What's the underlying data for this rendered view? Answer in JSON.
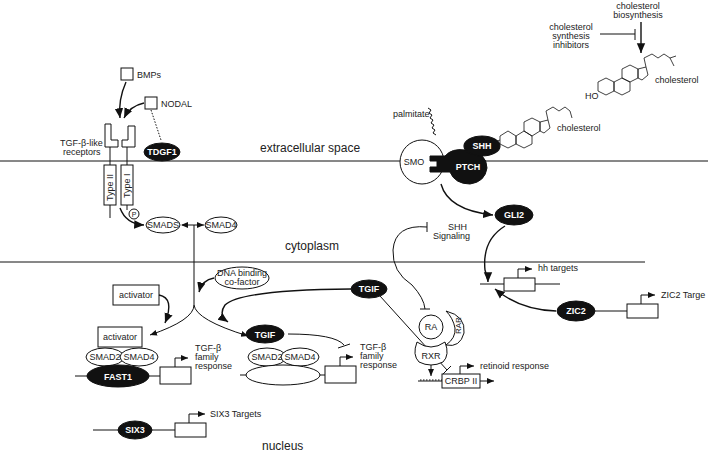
{
  "compartments": {
    "extracellular": "extracellular space",
    "cytoplasm": "cytoplasm",
    "nucleus": "nucleus"
  },
  "tgf_pathway": {
    "ligands": [
      "BMPs",
      "NODAL"
    ],
    "coreceptor": "TDGF1",
    "receptors_label_1": "TGF-β-like",
    "receptors_label_2": "receptors",
    "type2": "Type II",
    "type1": "Type I",
    "phospho": "P",
    "smads": "SMADS",
    "smad4": "SMAD4",
    "dna_cofactor_1": "DNA binding",
    "dna_cofactor_2": "co-factor",
    "activator_top": "activator",
    "activator_bottom": "activator",
    "complex1": {
      "smad2": "SMAD2",
      "smad4": "SMAD4",
      "tf": "FAST1"
    },
    "response_1a": "TGF-β",
    "response_1b": "family",
    "response_1c": "response",
    "tgif_top": "TGIF",
    "complex2": {
      "tgif": "TGIF",
      "smad2": "SMAD2",
      "smad4": "SMAD4"
    },
    "response_2a": "TGF-β",
    "response_2b": "family",
    "response_2c": "response"
  },
  "shh_pathway": {
    "biosynthesis_1": "cholesterol",
    "biosynthesis_2": "biosynthesis",
    "inhibitors_1": "cholesterol",
    "inhibitors_2": "synthesis",
    "inhibitors_3": "inhibitors",
    "cholesterol_top": "cholesterol",
    "ho": "HO",
    "palmitate": "palmitate",
    "cholesterol_shh": "cholesterol",
    "shh": "SHH",
    "smo": "SMO",
    "ptch": "PTCH",
    "gli2": "GLI2",
    "shh_signaling_1": "SHH",
    "shh_signaling_2": "Signaling",
    "hh_targets": "hh targets",
    "zic2": "ZIC2",
    "zic2_targets": "ZIC2 Targe"
  },
  "retinoid_pathway": {
    "ra": "RA",
    "rar": "RAR",
    "rxr": "RXR",
    "crbp": "CRBP II",
    "retinoid_response": "retinoid response"
  },
  "six3": {
    "tf": "SIX3",
    "targets": "SIX3 Targets"
  }
}
